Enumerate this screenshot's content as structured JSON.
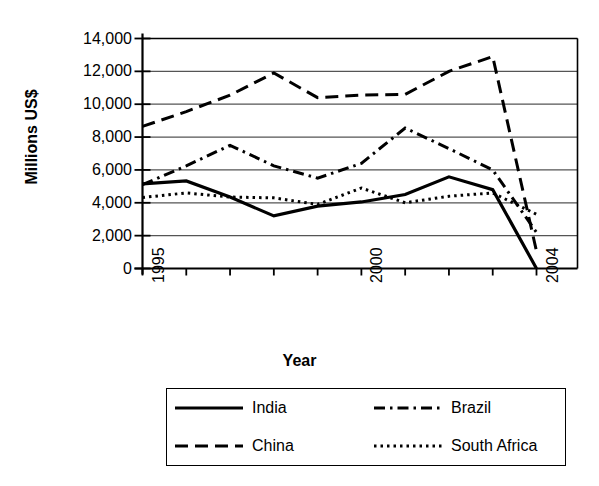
{
  "chart_data": {
    "type": "line",
    "title": "",
    "xlabel": "Year",
    "ylabel": "Millions US$",
    "xlim": [
      1995,
      2004
    ],
    "ylim": [
      0,
      14000
    ],
    "grid": true,
    "legend_position": "bottom",
    "x": [
      1995,
      1996,
      1997,
      1998,
      1999,
      2000,
      2001,
      2002,
      2003,
      2004
    ],
    "x_tick_labels": [
      "1995",
      "",
      "",
      "",
      "",
      "2000",
      "",
      "",
      "",
      "2004"
    ],
    "y_tick_labels": [
      "14,000",
      "12,000",
      "10,000",
      "8,000",
      "6,000",
      "4,000",
      "2,000",
      "0"
    ],
    "y_ticks": [
      14000,
      12000,
      10000,
      8000,
      6000,
      4000,
      2000,
      0
    ],
    "series": [
      {
        "name": "India",
        "style": "solid",
        "color": "#000000",
        "values": [
          5150,
          5330,
          4350,
          3200,
          3800,
          4050,
          4500,
          5580,
          4800,
          0
        ]
      },
      {
        "name": "China",
        "style": "long-dash",
        "color": "#000000",
        "values": [
          8650,
          9550,
          10550,
          11900,
          10400,
          10550,
          10600,
          12000,
          12900,
          1050
        ]
      },
      {
        "name": "Brazil",
        "style": "dash-dot",
        "color": "#000000",
        "values": [
          5100,
          6250,
          7500,
          6250,
          5500,
          6400,
          8550,
          7300,
          6000,
          2200
        ]
      },
      {
        "name": "South Africa",
        "style": "dotted",
        "color": "#000000",
        "values": [
          4320,
          4600,
          4350,
          4300,
          3900,
          4900,
          4000,
          4400,
          4600,
          3300
        ]
      }
    ]
  },
  "axes": {
    "y_title": "Millions US$",
    "x_title": "Year"
  },
  "legend": {
    "entries": [
      {
        "label": "India",
        "style": "solid"
      },
      {
        "label": "Brazil",
        "style": "dash-dot"
      },
      {
        "label": "China",
        "style": "long-dash"
      },
      {
        "label": "South Africa",
        "style": "dotted"
      }
    ]
  }
}
